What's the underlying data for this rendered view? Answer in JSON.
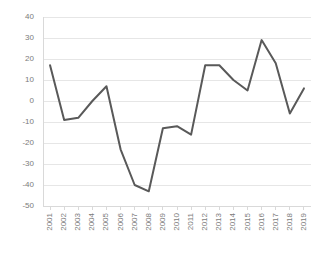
{
  "chart_data": {
    "type": "line",
    "title": "",
    "subtitle": "",
    "xlabel": "",
    "ylabel": "",
    "categories": [
      "2001",
      "2002",
      "2003",
      "2004",
      "2005",
      "2006",
      "2007",
      "2008",
      "2009",
      "2010",
      "2011",
      "2012",
      "2013",
      "2014",
      "2015",
      "2016",
      "2017",
      "2018",
      "2019"
    ],
    "values": [
      17,
      -9,
      -8,
      0,
      7,
      -23,
      -40,
      -43,
      -13,
      -12,
      -16,
      17,
      17,
      10,
      5,
      29,
      18,
      -6,
      6
    ],
    "series": [
      {
        "name": "series-1",
        "values": [
          17,
          -9,
          -8,
          0,
          7,
          -23,
          -40,
          -43,
          -13,
          -12,
          -16,
          17,
          17,
          10,
          5,
          29,
          18,
          -6,
          6
        ]
      }
    ],
    "ylim": [
      -50,
      40
    ],
    "yticks": [
      40,
      30,
      20,
      10,
      0,
      -10,
      -20,
      -30,
      -40,
      -50
    ],
    "ytick_labels": [
      "40",
      "30",
      "20",
      "10",
      "0",
      "-10",
      "-20",
      "-30",
      "-40",
      "-50"
    ],
    "xtick_labels": [
      "2001",
      "2002",
      "2003",
      "2004",
      "2005",
      "2006",
      "2007",
      "2008",
      "2009",
      "2010",
      "2011",
      "2012",
      "2013",
      "2014",
      "2015",
      "2016",
      "2017",
      "2018",
      "2019"
    ],
    "grid": true,
    "grid_axis": "y",
    "legend": false,
    "legend_position": "none",
    "line_color": "#595959",
    "grid_color": "#e6e6e6",
    "axis_color": "#d9d9d9",
    "tick_label_color": "#7b7b7b",
    "background_color": "#ffffff",
    "line_width": 2
  }
}
